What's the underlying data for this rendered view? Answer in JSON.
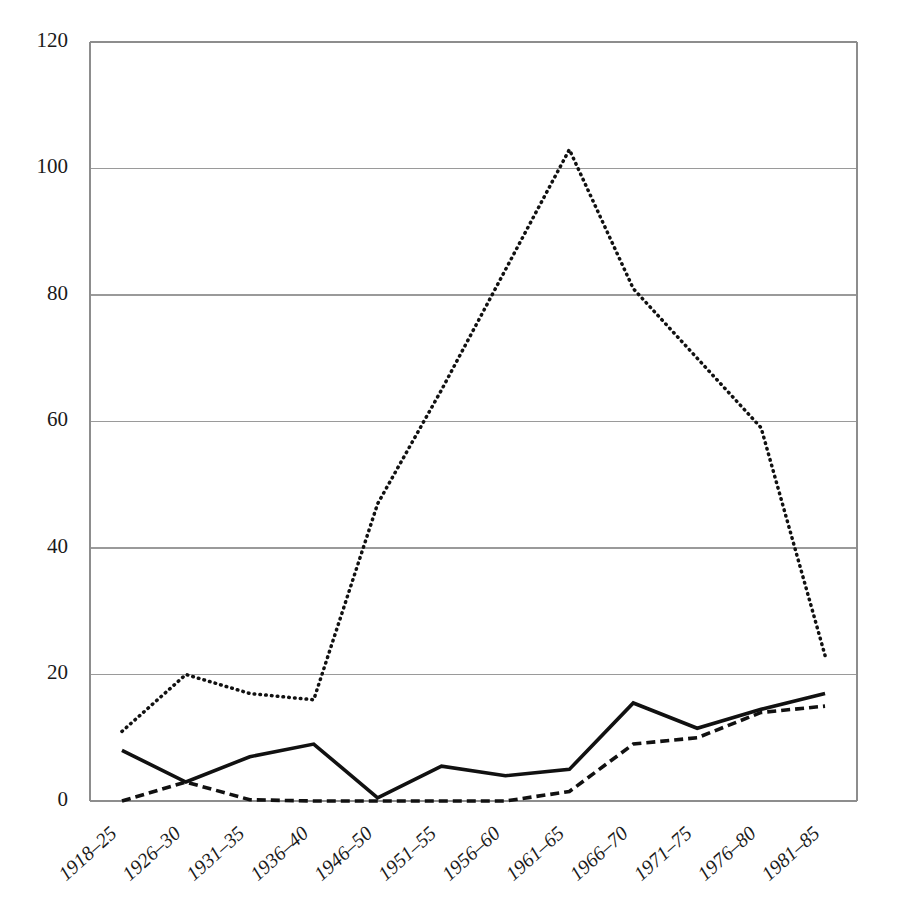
{
  "chart_data": {
    "type": "line",
    "title": "",
    "subtitle": "",
    "xlabel": "",
    "ylabel": "",
    "categories": [
      "1918–25",
      "1926–30",
      "1931–35",
      "1936–40",
      "1946–50",
      "1951–55",
      "1956–60",
      "1961–65",
      "1966–70",
      "1971–75",
      "1976–80",
      "1981–85"
    ],
    "yticks": [
      0,
      20,
      40,
      60,
      80,
      100,
      120
    ],
    "ytick_labels": [
      "0",
      "20",
      "40",
      "60",
      "80",
      "100",
      "120"
    ],
    "ylim": [
      0,
      120
    ],
    "grid": "horizontal",
    "legend": "none",
    "series": [
      {
        "name": "dotted-series",
        "style": "dotted",
        "color": "#111111",
        "values": [
          11,
          20,
          17,
          16,
          47,
          65,
          84,
          103,
          81,
          70,
          59,
          23
        ]
      },
      {
        "name": "solid-series",
        "style": "solid",
        "color": "#111111",
        "values": [
          8,
          3,
          7,
          9,
          0.5,
          5.5,
          4,
          5,
          15.5,
          11.5,
          14.5,
          17
        ]
      },
      {
        "name": "dashed-series",
        "style": "dashed",
        "color": "#111111",
        "values": [
          0,
          3,
          0.2,
          0,
          0,
          0,
          0,
          1.5,
          9,
          10,
          14,
          15
        ]
      }
    ],
    "axis_color": "#8d8d8d",
    "grid_color": "#9a9a9a"
  }
}
